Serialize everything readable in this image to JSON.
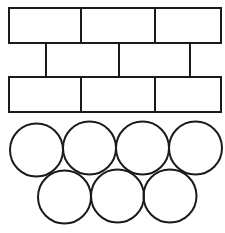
{
  "diagram": {
    "stroke_color": "#1a1a1a",
    "background": "#ffffff",
    "bricks": {
      "rows": [
        {
          "y": 8,
          "height": 35,
          "x0": 9,
          "x1": 221,
          "dividers": [
            81,
            155
          ]
        },
        {
          "y": 43,
          "height": 34,
          "x0": 46,
          "x1": 190,
          "dividers": [
            119
          ],
          "edges": [
            46,
            190
          ]
        },
        {
          "y": 77,
          "height": 35,
          "x0": 9,
          "x1": 221,
          "dividers": [
            81,
            155
          ]
        }
      ]
    },
    "circles": {
      "radius": 26.5,
      "top_row": [
        {
          "cx": 36.5,
          "cy": 150
        },
        {
          "cx": 89.5,
          "cy": 148
        },
        {
          "cx": 142.5,
          "cy": 148
        },
        {
          "cx": 195.5,
          "cy": 148
        }
      ],
      "bottom_row": [
        {
          "cx": 64.5,
          "cy": 197
        },
        {
          "cx": 117.5,
          "cy": 196
        },
        {
          "cx": 170,
          "cy": 196
        }
      ]
    }
  }
}
